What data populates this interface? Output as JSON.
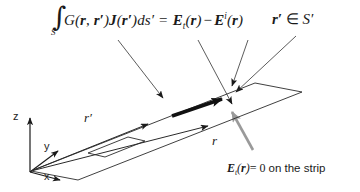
{
  "figure": {
    "background": "#ffffff",
    "ink": "#1a1a1a",
    "accent_gray": "#999999"
  },
  "equation": {
    "integral_symbol": "∫",
    "integral_lower_limit": "S′",
    "kernel": "G(",
    "kernel_arg1": "r",
    "kernel_comma": ", ",
    "kernel_arg2": "r′",
    "kernel_close": ")",
    "current": "J",
    "current_open": "(",
    "current_arg": "r′",
    "current_close": ")",
    "measure": "ds′",
    "relation": "=",
    "rhs_field_total": "E",
    "rhs_total_subscript": "t",
    "rhs_total_open": "(",
    "rhs_total_arg": "r",
    "rhs_total_close": ")",
    "minus": "−",
    "rhs_field_incident": "E",
    "rhs_incident_superscript": "i",
    "rhs_incident_open": "(",
    "rhs_incident_arg": "r",
    "rhs_incident_close": ")"
  },
  "membership": {
    "variable": "r′",
    "operator": "∈",
    "domain": "S′"
  },
  "boundary_condition": {
    "field": "E",
    "subscript": "t",
    "open": "(",
    "arg": "r",
    "close": ")",
    "equals": "= 0",
    "note": "on the strip"
  },
  "axes": {
    "z_label": "z",
    "y_label": "y",
    "x_label": "x"
  },
  "vectors": {
    "source_label": "r′",
    "observation_label": "r"
  },
  "annotations": {
    "leader_to_current": "J(r′) current arrow on strip",
    "leader_to_observation": "observation point on strip",
    "leader_to_source_domain": "source surface S′"
  }
}
